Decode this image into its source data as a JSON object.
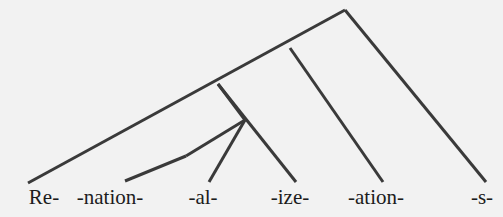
{
  "figure": {
    "kind": "morphological-derivation-tree",
    "word": "Re-nation-al-ize-ation-s",
    "background_color": "#f2f2f2",
    "branch_color": "#3a3a3a",
    "text_color": "#1c1c1c",
    "branch_width": 3,
    "width": 503,
    "height": 217
  },
  "leaves": [
    {
      "label": "Re-",
      "x": 44,
      "y": 203,
      "tip_x": 28,
      "tip_y": 183
    },
    {
      "label": "-nation-",
      "x": 110,
      "y": 203,
      "tip_x": 125,
      "tip_y": 181
    },
    {
      "label": "-al-",
      "x": 203,
      "y": 203,
      "tip_x": 209,
      "tip_y": 182
    },
    {
      "label": "-ize-",
      "x": 290,
      "y": 203,
      "tip_x": 296,
      "tip_y": 182
    },
    {
      "label": "-ation-",
      "x": 376,
      "y": 203,
      "tip_x": 383,
      "tip_y": 182
    },
    {
      "label": "-s-",
      "x": 482,
      "y": 203,
      "tip_x": 486,
      "tip_y": 182
    }
  ],
  "nodes": [
    {
      "name": "root",
      "x": 345,
      "y": 10
    },
    {
      "name": "node-2",
      "x": 290,
      "y": 48
    },
    {
      "name": "node-3",
      "x": 218,
      "y": 84
    },
    {
      "name": "node-4",
      "x": 245,
      "y": 120
    },
    {
      "name": "node-5",
      "x": 186,
      "y": 156
    }
  ],
  "branches": [
    {
      "name": "root-to-left-spine",
      "x1": 345,
      "y1": 10,
      "x2": 28,
      "y2": 183
    },
    {
      "name": "root-to-s",
      "x1": 345,
      "y1": 10,
      "x2": 486,
      "y2": 182
    },
    {
      "name": "node2-to-ation",
      "x1": 290,
      "y1": 48,
      "x2": 383,
      "y2": 182
    },
    {
      "name": "node3-to-ize",
      "x1": 218,
      "y1": 84,
      "x2": 296,
      "y2": 182
    },
    {
      "name": "node4-to-al",
      "x1": 245,
      "y1": 120,
      "x2": 209,
      "y2": 182
    },
    {
      "name": "node5-to-nation",
      "x1": 186,
      "y1": 156,
      "x2": 125,
      "y2": 181
    },
    {
      "name": "node3-stem",
      "x1": 218,
      "y1": 84,
      "x2": 245,
      "y2": 120
    },
    {
      "name": "node4-stem",
      "x1": 245,
      "y1": 120,
      "x2": 186,
      "y2": 156
    }
  ]
}
